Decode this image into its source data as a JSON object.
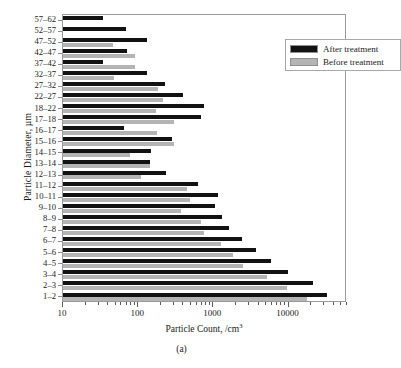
{
  "figure": {
    "caption": "(a)"
  },
  "legend": {
    "position": "top-right",
    "entries": [
      {
        "label": "After treatment",
        "color": "#121212"
      },
      {
        "label": "Before treatment",
        "color": "#b4b4b4"
      }
    ]
  },
  "chart_data": {
    "type": "bar",
    "orientation": "horizontal",
    "title": "",
    "xlabel": "Particle Count, /cm3",
    "xlabel_html": "Particle Count, /cm<sup>3</sup>",
    "ylabel": "Particle Diameter, µm",
    "xscale": "log",
    "xlim": [
      10,
      60000
    ],
    "xticks": [
      10,
      100,
      1000,
      10000
    ],
    "xticklabels": [
      "10",
      "100",
      "1000",
      "10000"
    ],
    "grid": false,
    "categories": [
      "57–62",
      "52–57",
      "47–52",
      "42–47",
      "37–42",
      "32–37",
      "27–32",
      "22–27",
      "18–22",
      "17–18",
      "16–17",
      "15–16",
      "14–15",
      "13–14",
      "12–13",
      "11–12",
      "10–11",
      "9–10",
      "8–9",
      "7–8",
      "6–7",
      "5–6",
      "4–5",
      "3–4",
      "2–3",
      "1–2"
    ],
    "series": [
      {
        "name": "After treatment",
        "color": "#121212",
        "values": [
          34,
          68,
          130,
          70,
          34,
          130,
          225,
          400,
          760,
          690,
          64,
          280,
          150,
          145,
          235,
          620,
          1150,
          1050,
          1300,
          1600,
          2400,
          3700,
          5800,
          9800,
          21000,
          33000
        ]
      },
      {
        "name": "Before treatment",
        "color": "#b4b4b4",
        "values": [
          0,
          0,
          46,
          92,
          92,
          47,
          185,
          215,
          175,
          300,
          180,
          300,
          78,
          142,
          110,
          440,
          490,
          370,
          690,
          760,
          1250,
          1850,
          2500,
          5200,
          9500,
          17500
        ]
      }
    ],
    "legend_position": "upper right"
  }
}
